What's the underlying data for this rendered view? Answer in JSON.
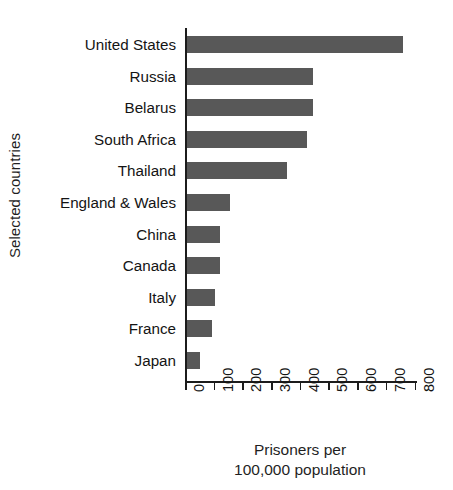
{
  "chart_data": {
    "type": "bar",
    "orientation": "horizontal",
    "title": "",
    "xlabel": "Prisoners per 100,000 population",
    "xlabel_lines": [
      "Prisoners per",
      "100,000 population"
    ],
    "ylabel": "Selected countries",
    "categories": [
      "United States",
      "Russia",
      "Belarus",
      "South Africa",
      "Thailand",
      "England & Wales",
      "China",
      "Canada",
      "Italy",
      "France",
      "Japan"
    ],
    "values": [
      755,
      440,
      440,
      420,
      350,
      150,
      115,
      115,
      100,
      90,
      48
    ],
    "xlim": [
      0,
      800
    ],
    "xticks": [
      0,
      100,
      200,
      300,
      400,
      500,
      600,
      700,
      800
    ],
    "xtick_labels": [
      "0",
      "100",
      "200",
      "300",
      "400",
      "500",
      "600",
      "700",
      "800"
    ],
    "grid": false,
    "legend": null,
    "bar_color": "#585858",
    "axis_color": "#1c1c1c",
    "background": "#ffffff"
  }
}
